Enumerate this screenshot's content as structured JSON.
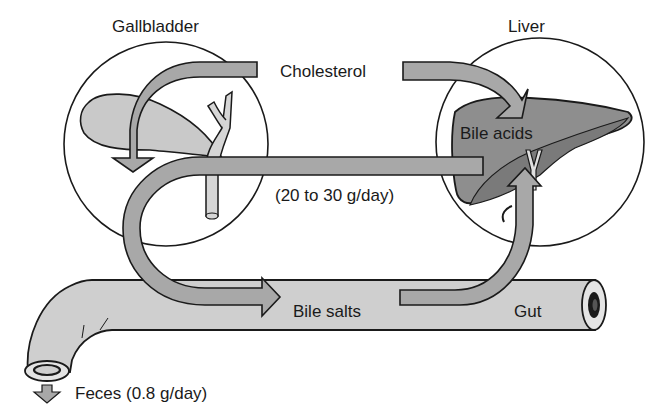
{
  "diagram": {
    "type": "enterohepatic-circulation",
    "labels": {
      "gallbladder": "Gallbladder",
      "liver": "Liver",
      "cholesterol": "Cholesterol",
      "bile_acids": "Bile acids",
      "recirculation_rate": "(20 to 30 g/day)",
      "bile_salts": "Bile salts",
      "gut": "Gut",
      "feces": "Feces (0.8 g/day)"
    },
    "flows": [
      {
        "from": "Cholesterol",
        "to": "Liver",
        "label": "Bile acids"
      },
      {
        "from": "Liver",
        "to": "Gallbladder"
      },
      {
        "from": "Gallbladder",
        "to": "Gut",
        "label": "Bile salts"
      },
      {
        "from": "Gut",
        "to": "Liver",
        "label": "(20 to 30 g/day)"
      },
      {
        "from": "Gut",
        "to": "Feces",
        "label": "Feces (0.8 g/day)"
      }
    ],
    "colors": {
      "arrow_fill": "#a8a8a8",
      "organ_fill_light": "#c9c9c9",
      "liver_fill": "#8e8e8e",
      "liver_lobe_dark": "#7a7a7a",
      "gut_fill": "#cfcfcf",
      "outline": "#1a1a1a"
    }
  }
}
